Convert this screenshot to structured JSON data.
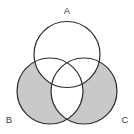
{
  "figure": {
    "type": "venn-diagram",
    "title": "",
    "width": 134,
    "height": 134,
    "background_color": "#ffffff",
    "stroke_color": "#2b2b2b",
    "stroke_width": 1.2,
    "shade_color": "#c9c9c9",
    "unshaded_color": "#ffffff",
    "label_color": "#3a3a3a"
  },
  "sets": [
    {
      "id": "A",
      "label": "A",
      "label_x": 67,
      "label_y": 11,
      "cx": 67,
      "cy": 54.5,
      "r": 33,
      "filled": false
    },
    {
      "id": "B",
      "label": "B",
      "label_x": 9,
      "label_y": 120,
      "cx": 50,
      "cy": 91,
      "r": 33,
      "filled": true
    },
    {
      "id": "C",
      "label": "C",
      "label_x": 125,
      "label_y": 120,
      "cx": 84,
      "cy": 91,
      "r": 33,
      "filled": true
    }
  ],
  "regions": [
    {
      "id": "A-only",
      "expression": "A only",
      "shaded": false
    },
    {
      "id": "B-only",
      "expression": "B only",
      "shaded": true
    },
    {
      "id": "C-only",
      "expression": "C only",
      "shaded": true
    },
    {
      "id": "A-and-B",
      "expression": "A and B, not C",
      "shaded": false
    },
    {
      "id": "A-and-C",
      "expression": "A and C, not B",
      "shaded": false
    },
    {
      "id": "B-and-C",
      "expression": "B and C, not A",
      "shaded": false
    },
    {
      "id": "A-and-B-and-C",
      "expression": "A and B and C",
      "shaded": false
    },
    {
      "id": "outside",
      "expression": "outside all sets",
      "shaded": false
    }
  ],
  "shaded_description": "(B union C) minus (A union (B intersect C))"
}
